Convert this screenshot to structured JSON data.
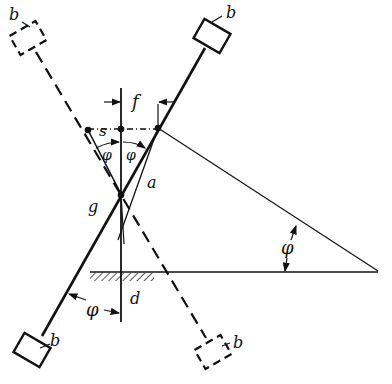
{
  "diagram": {
    "type": "mechanical-geometry",
    "colors": {
      "ink": "#111111",
      "background": "#ffffff"
    },
    "labels": {
      "b_top_left": "b",
      "b_top_right": "b",
      "b_bottom_left": "b",
      "b_bottom_right": "b",
      "f": "f",
      "s": "s",
      "a": "a",
      "g": "g",
      "d": "d",
      "phi_left": "φ",
      "phi_right": "φ",
      "phi_bottom": "φ",
      "phi_triangle": "φ"
    }
  }
}
